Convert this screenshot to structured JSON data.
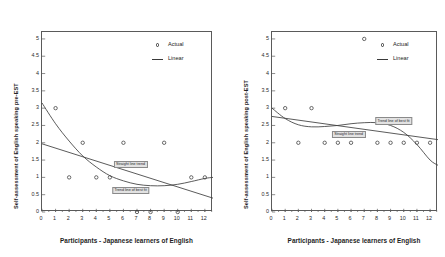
{
  "figure": {
    "background_color": "#ffffff",
    "axis_color": "#5a5a5a",
    "line_color": "#3d3d3d",
    "marker_color": "#3a3a3a",
    "callout_fill": "#e2e2e2"
  },
  "panels": [
    {
      "id": "pre-est",
      "ylabel": "Self-assessment of English speaking pre-EST",
      "xlabel": "Participants - Japanese learners of English",
      "yticks": [
        "0",
        "0.5",
        "1",
        "1.5",
        "2",
        "2.5",
        "3",
        "3.5",
        "4",
        "4.5",
        "5"
      ],
      "xticks": [
        "0",
        "1",
        "2",
        "3",
        "4",
        "5",
        "6",
        "7",
        "8",
        "9",
        "10",
        "11",
        "12"
      ],
      "legend": [
        {
          "label": "Actual",
          "symbol": "circle-marker"
        },
        {
          "label": "Linear",
          "symbol": "line-segment"
        }
      ],
      "annotations": [
        {
          "text": "Straight line trend"
        },
        {
          "text": "Trend line of best fit"
        }
      ]
    },
    {
      "id": "post-est",
      "ylabel": "Self-assessment of English speaking post-EST",
      "xlabel": "Participants - Japanese learners of English",
      "yticks": [
        "0",
        "0.5",
        "1",
        "1.5",
        "2",
        "2.5",
        "3",
        "3.5",
        "4",
        "4.5",
        "5"
      ],
      "xticks": [
        "0",
        "1",
        "2",
        "3",
        "4",
        "5",
        "6",
        "7",
        "8",
        "9",
        "10",
        "11",
        "12"
      ],
      "legend": [
        {
          "label": "Actual",
          "symbol": "circle-marker"
        },
        {
          "label": "Linear",
          "symbol": "line-segment"
        }
      ],
      "annotations": [
        {
          "text": "Trend line of best fit"
        },
        {
          "text": "Straight line trend"
        }
      ]
    }
  ],
  "chart_data": [
    {
      "type": "scatter",
      "id": "pre-est",
      "title": "",
      "xlabel": "Participants - Japanese learners of English",
      "ylabel": "Self-assessment of English speaking pre-EST",
      "xlim": [
        0,
        12.6
      ],
      "ylim": [
        0,
        5.2
      ],
      "xticks": [
        0,
        1,
        2,
        3,
        4,
        5,
        6,
        7,
        8,
        9,
        10,
        11,
        12
      ],
      "yticks": [
        0,
        0.5,
        1,
        1.5,
        2,
        2.5,
        3,
        3.5,
        4,
        4.5,
        5
      ],
      "grid": false,
      "legend_position": "top-right",
      "series": [
        {
          "name": "Actual",
          "type": "scatter",
          "marker": "open-circle",
          "x": [
            1,
            2,
            3,
            4,
            5,
            6,
            7,
            8,
            9,
            10,
            11,
            12
          ],
          "y": [
            3,
            1,
            2,
            1,
            1,
            2,
            0,
            0,
            2,
            0,
            1,
            1
          ]
        },
        {
          "name": "Straight line trend",
          "type": "line",
          "x": [
            0,
            12.6
          ],
          "y": [
            1.97,
            0.4
          ]
        },
        {
          "name": "Trend line of best fit",
          "type": "line",
          "x": [
            0,
            1,
            2,
            3,
            4,
            5,
            6,
            7,
            8,
            9,
            10,
            11,
            12,
            12.6
          ],
          "y": [
            3.15,
            2.55,
            2.05,
            1.62,
            1.3,
            1.05,
            0.9,
            0.8,
            0.76,
            0.76,
            0.8,
            0.88,
            0.97,
            1.0
          ]
        }
      ],
      "annotations": [
        {
          "text": "Straight line trend",
          "x": 6.6,
          "y": 1.37
        },
        {
          "text": "Trend line of best fit",
          "x": 6.6,
          "y": 0.62
        }
      ]
    },
    {
      "type": "scatter",
      "id": "post-est",
      "title": "",
      "xlabel": "Participants - Japanese learners of English",
      "ylabel": "Self-assessment of English speaking post-EST",
      "xlim": [
        0,
        12.6
      ],
      "ylim": [
        0,
        5.2
      ],
      "xticks": [
        0,
        1,
        2,
        3,
        4,
        5,
        6,
        7,
        8,
        9,
        10,
        11,
        12
      ],
      "yticks": [
        0,
        0.5,
        1,
        1.5,
        2,
        2.5,
        3,
        3.5,
        4,
        4.5,
        5
      ],
      "grid": false,
      "legend_position": "top-right",
      "series": [
        {
          "name": "Actual",
          "type": "scatter",
          "marker": "open-circle",
          "x": [
            1,
            2,
            3,
            4,
            5,
            6,
            7,
            8,
            9,
            10,
            11,
            12
          ],
          "y": [
            3,
            2,
            3,
            2,
            2,
            2,
            5,
            2,
            2,
            2,
            2,
            2
          ]
        },
        {
          "name": "Straight line trend",
          "type": "line",
          "x": [
            0,
            12.6
          ],
          "y": [
            2.76,
            2.09
          ]
        },
        {
          "name": "Trend line of best fit",
          "type": "line",
          "x": [
            0,
            1,
            2,
            3,
            4,
            5,
            6,
            7,
            8,
            9,
            10,
            11,
            12,
            12.6
          ],
          "y": [
            3.0,
            2.7,
            2.52,
            2.46,
            2.47,
            2.5,
            2.55,
            2.58,
            2.58,
            2.5,
            2.3,
            1.95,
            1.5,
            1.35
          ]
        }
      ],
      "annotations": [
        {
          "text": "Trend line of best fit",
          "x": 9.3,
          "y": 2.62
        },
        {
          "text": "Straight line trend",
          "x": 5.9,
          "y": 2.23
        }
      ]
    }
  ]
}
